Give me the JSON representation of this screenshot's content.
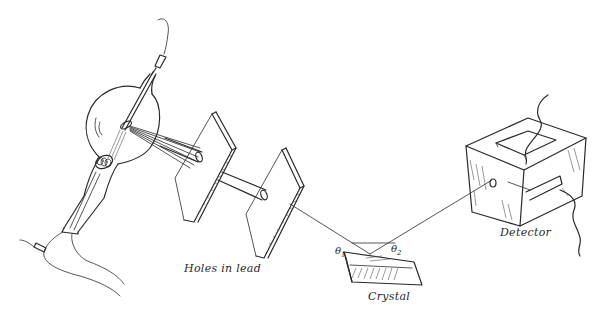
{
  "diagram": {
    "type": "X-ray crystal diffraction apparatus (Bragg spectrometer) sketch",
    "labels": {
      "holes": "Holes in lead",
      "crystal": "Crystal",
      "detector": "Detector",
      "theta1_symbol": "θ",
      "theta1_sub": "1",
      "theta2_symbol": "θ",
      "theta2_sub": "2"
    },
    "components": [
      {
        "id": "xray-tube",
        "description": "Glass X-ray tube with bulb, cathode filament coil and anode target"
      },
      {
        "id": "lead-plate-1",
        "description": "First lead plate with hole (collimator)"
      },
      {
        "id": "lead-plate-2",
        "description": "Second lead plate with hole (collimator)"
      },
      {
        "id": "crystal",
        "description": "Crystal slab reflecting the beam"
      },
      {
        "id": "detector",
        "description": "Box-shaped detector with entrance window and wires"
      }
    ],
    "colors": {
      "ink": "#2a2a2a",
      "background": "#ffffff"
    }
  }
}
